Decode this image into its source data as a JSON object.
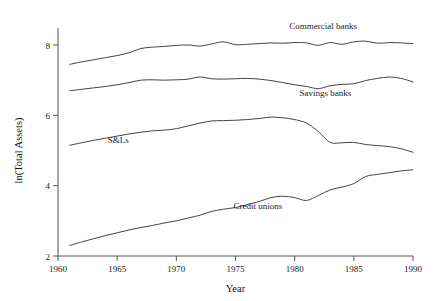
{
  "chart_data": {
    "type": "line",
    "title": "",
    "xlabel": "Year",
    "ylabel": "ln(Total Assets)",
    "xlim": [
      1960,
      1990
    ],
    "ylim": [
      2,
      8.6
    ],
    "grid": false,
    "legend_position": "inline-annotations",
    "xticks": [
      1960,
      1965,
      1970,
      1975,
      1980,
      1985,
      1990
    ],
    "xticklabels": [
      "1960",
      "1965",
      "1970",
      "1975",
      "1980",
      "1985",
      "1990"
    ],
    "yticks": [
      2,
      4,
      6,
      8
    ],
    "yticklabels": [
      "2",
      "4",
      "6",
      "8"
    ],
    "x": [
      1961,
      1962,
      1963,
      1964,
      1965,
      1966,
      1967,
      1968,
      1969,
      1970,
      1971,
      1972,
      1973,
      1974,
      1975,
      1976,
      1977,
      1978,
      1979,
      1980,
      1981,
      1982,
      1983,
      1984,
      1985,
      1986,
      1987,
      1988,
      1989,
      1990
    ],
    "series": [
      {
        "name": "Commercial banks",
        "label_x": 1982.4,
        "label_y": 8.46,
        "values": [
          7.45,
          7.52,
          7.58,
          7.64,
          7.7,
          7.78,
          7.9,
          7.94,
          7.96,
          7.99,
          8.0,
          7.97,
          8.03,
          8.09,
          8.01,
          8.02,
          8.04,
          8.06,
          8.05,
          8.07,
          8.06,
          7.99,
          8.07,
          8.02,
          8.09,
          8.11,
          8.05,
          8.07,
          8.06,
          8.04
        ]
      },
      {
        "name": "Savings banks",
        "label_x": 1982.6,
        "label_y": 6.55,
        "values": [
          6.7,
          6.74,
          6.78,
          6.82,
          6.87,
          6.93,
          7.0,
          7.01,
          7.0,
          7.01,
          7.03,
          7.09,
          7.04,
          7.03,
          7.04,
          7.05,
          7.03,
          6.99,
          6.93,
          6.87,
          6.82,
          6.76,
          6.84,
          6.88,
          6.9,
          6.99,
          7.05,
          7.09,
          7.05,
          6.95
        ]
      },
      {
        "name": "S&Ls",
        "label_x": 1965.1,
        "label_y": 5.22,
        "values": [
          5.15,
          5.22,
          5.29,
          5.35,
          5.41,
          5.47,
          5.52,
          5.56,
          5.58,
          5.62,
          5.7,
          5.78,
          5.84,
          5.85,
          5.86,
          5.88,
          5.91,
          5.95,
          5.93,
          5.88,
          5.78,
          5.54,
          5.23,
          5.22,
          5.23,
          5.17,
          5.14,
          5.11,
          5.05,
          4.95
        ]
      },
      {
        "name": "Credit unions",
        "label_x": 1976.9,
        "label_y": 3.33,
        "values": [
          2.3,
          2.4,
          2.49,
          2.58,
          2.66,
          2.74,
          2.81,
          2.87,
          2.94,
          3.0,
          3.08,
          3.16,
          3.27,
          3.33,
          3.38,
          3.46,
          3.55,
          3.66,
          3.7,
          3.66,
          3.58,
          3.72,
          3.88,
          3.96,
          4.06,
          4.26,
          4.32,
          4.37,
          4.42,
          4.45
        ]
      }
    ]
  }
}
